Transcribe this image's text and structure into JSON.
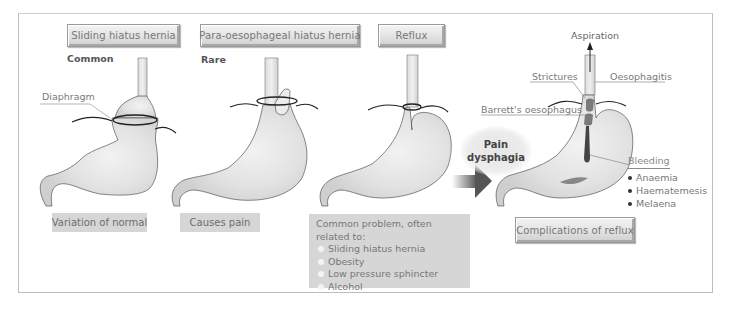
{
  "panels": [
    {
      "title": "Sliding hiatus hernia",
      "subtitle": "Common",
      "caption": "Variation of normal"
    },
    {
      "title": "Para-oesophageal hiatus hernia",
      "subtitle": "Rare",
      "caption": "Causes pain"
    },
    {
      "title": "Reflux",
      "caption_heading": "Common problem, often related to:",
      "caption_items": [
        "Sliding hiatus hernia",
        "Obesity",
        "Low pressure sphincter",
        "Alcohol"
      ]
    }
  ],
  "labels": {
    "diaphragm": "Diaphragm"
  },
  "complications": {
    "title": "Complications of reflux",
    "aspiration": "Aspiration",
    "strictures": "Strictures",
    "oesophagitis": "Oesophagitis",
    "barretts": "Barrett's oesophagus",
    "pain_line1": "Pain",
    "pain_line2": "dysphagia",
    "bleeding": "Bleeding",
    "bleeding_items": [
      "Anaemia",
      "Haematemesis",
      "Melaena"
    ]
  },
  "colors": {
    "stomach_fill": "#e4e4e4",
    "stomach_stroke": "#555555",
    "label_box": "#d6d6d6",
    "arrow": "#6a6a6a"
  }
}
